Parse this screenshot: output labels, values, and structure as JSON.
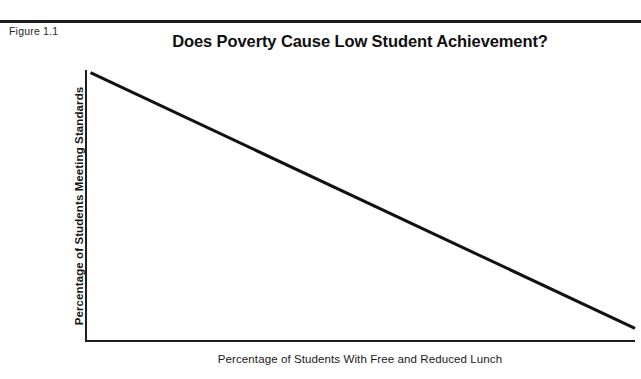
{
  "figure": {
    "label": "Figure 1.1",
    "clipped_text_above": "",
    "rule_color": "#1c1c1c"
  },
  "chart_data": {
    "type": "line",
    "title": "Does Poverty Cause Low Student Achievement?",
    "xlabel": "Percentage of Students With Free and Reduced Lunch",
    "ylabel": "Percentage of Students Meeting Standards",
    "grid": false,
    "legend": "none",
    "ticks": "none",
    "xlim": [
      0,
      100
    ],
    "ylim": [
      0,
      100
    ],
    "line_color": "#111111",
    "line_width": 3,
    "series": [
      {
        "name": "Achievement vs Poverty",
        "x": [
          1,
          100
        ],
        "values": [
          99,
          5
        ],
        "relationship": "negative linear"
      }
    ],
    "annotations": []
  }
}
